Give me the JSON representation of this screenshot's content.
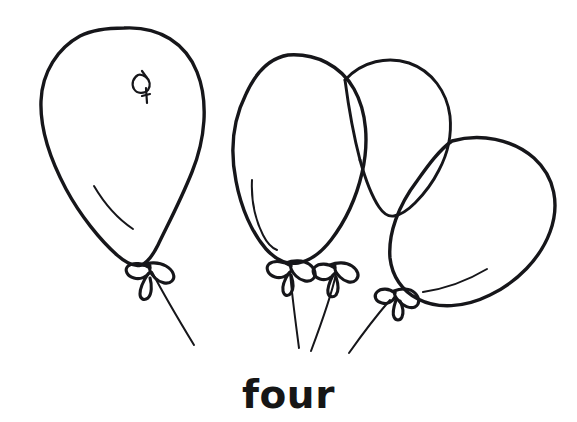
{
  "page": {
    "background_color": "#ffffff",
    "ink_color": "#16161a",
    "width": 577,
    "height": 422
  },
  "caption": {
    "text": "four",
    "color": "#161616"
  },
  "illustration": {
    "subject": "balloons",
    "count": 4,
    "style": "black-and-white line art",
    "balloons": [
      {
        "id": "balloon-1",
        "label": "large left balloon",
        "shape": "teardrop",
        "has_highlight": true,
        "has_bow_knot": true,
        "has_string": true,
        "has_decorative_mark": true
      },
      {
        "id": "balloon-2",
        "label": "center balloon",
        "shape": "oval",
        "has_highlight": true,
        "has_bow_knot": true,
        "has_string": true,
        "has_decorative_mark": false
      },
      {
        "id": "balloon-3",
        "label": "back balloon",
        "shape": "oval",
        "has_highlight": false,
        "has_bow_knot": true,
        "has_string": true,
        "has_decorative_mark": false
      },
      {
        "id": "balloon-4",
        "label": "tilted right balloon",
        "shape": "tilted oval",
        "has_highlight": true,
        "has_bow_knot": true,
        "has_string": true,
        "has_decorative_mark": false
      }
    ]
  }
}
